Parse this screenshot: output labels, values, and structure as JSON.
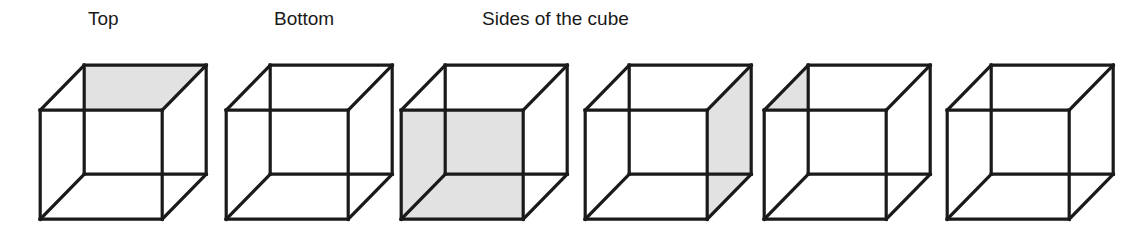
{
  "figure": {
    "background_color": "#FFFFFF",
    "stroke_color": "#1A1A1A",
    "shade_color": "#E2E2E2",
    "face_unshaded_color": "#FFFFFF",
    "width": 1137,
    "height": 234
  },
  "captions": [
    {
      "label": "Top",
      "x": 88,
      "align": "left",
      "for_cube_index": 0
    },
    {
      "label": "Bottom",
      "x": 274,
      "align": "left",
      "for_cube_index": 1
    },
    {
      "label": "Sides of the cube",
      "x": 482,
      "align": "left",
      "for_cube_index": 2
    }
  ],
  "cube_geometry": {
    "note": "Oblique parallel projection. Back square is up-right, front square is down-left, within a 170x165 box.",
    "box_w": 170,
    "box_h": 165,
    "front": {
      "x1": 4,
      "y1": 52,
      "x2": 126,
      "y2": 161
    },
    "back": {
      "x1": 48,
      "y1": 7,
      "x2": 170,
      "y2": 116
    },
    "stroke_width": 3.2
  },
  "cubes": [
    {
      "name": "cube-top-shaded",
      "x": 33,
      "shaded_face": "top",
      "shaded_face_label": "Top"
    },
    {
      "name": "cube-bottom-shaded",
      "x": 219,
      "shaded_face": "bottom",
      "shaded_face_label": "Bottom"
    },
    {
      "name": "cube-front-shaded",
      "x": 394,
      "shaded_face": "front",
      "shaded_face_label": "Front side"
    },
    {
      "name": "cube-right-shaded",
      "x": 578,
      "shaded_face": "right",
      "shaded_face_label": "Right side"
    },
    {
      "name": "cube-left-shaded",
      "x": 757,
      "shaded_face": "left",
      "shaded_face_label": "Left side"
    },
    {
      "name": "cube-back-shaded",
      "x": 940,
      "shaded_face": "back",
      "shaded_face_label": "Back side"
    }
  ]
}
